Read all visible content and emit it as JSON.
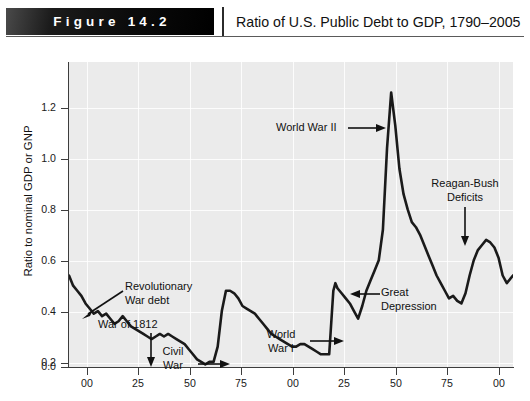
{
  "header": {
    "figure_label": "Figure 14.2",
    "title": "Ratio of U.S. Public Debt to GDP, 1790–2005"
  },
  "caption": "",
  "chart_data": {
    "type": "line",
    "title": "Ratio of U.S. Public Debt to GDP, 1790–2005",
    "xlabel": "",
    "ylabel": "Ratio to nominal GDP or GNP",
    "xlim": [
      1790,
      2005
    ],
    "ylim": [
      0.0,
      1.2
    ],
    "grid": true,
    "legend": "none",
    "line_color": "#1a1a1a",
    "plot_background": "#ebebeb",
    "ytick_labels": [
      "0.0",
      "0.2",
      "0.4",
      "0.6",
      "0.8",
      "1.0",
      "1.2"
    ],
    "ytick_values": [
      0.0,
      0.2,
      0.4,
      0.6,
      0.8,
      1.0,
      1.2
    ],
    "xtick_labels": [
      "00",
      "25",
      "50",
      "75",
      "00",
      "25",
      "50",
      "75",
      "00"
    ],
    "xtick_values": [
      1800,
      1825,
      1850,
      1875,
      1900,
      1925,
      1950,
      1975,
      2000
    ],
    "series": [
      {
        "name": "Public debt to GDP",
        "x": [
          1790,
          1792,
          1794,
          1796,
          1798,
          1800,
          1802,
          1804,
          1806,
          1808,
          1810,
          1812,
          1814,
          1816,
          1818,
          1820,
          1822,
          1824,
          1826,
          1828,
          1830,
          1832,
          1834,
          1836,
          1838,
          1840,
          1842,
          1844,
          1846,
          1848,
          1850,
          1852,
          1854,
          1856,
          1858,
          1860,
          1862,
          1864,
          1866,
          1868,
          1870,
          1872,
          1874,
          1876,
          1878,
          1880,
          1882,
          1884,
          1886,
          1888,
          1890,
          1892,
          1894,
          1896,
          1898,
          1900,
          1902,
          1904,
          1906,
          1908,
          1910,
          1912,
          1914,
          1916,
          1918,
          1919,
          1920,
          1922,
          1924,
          1926,
          1928,
          1930,
          1932,
          1934,
          1936,
          1938,
          1940,
          1942,
          1944,
          1946,
          1948,
          1950,
          1952,
          1954,
          1956,
          1958,
          1960,
          1962,
          1964,
          1966,
          1968,
          1970,
          1972,
          1974,
          1976,
          1978,
          1980,
          1982,
          1984,
          1986,
          1988,
          1990,
          1992,
          1994,
          1996,
          1998,
          2000,
          2002,
          2005
        ],
        "y": [
          0.36,
          0.32,
          0.3,
          0.28,
          0.25,
          0.23,
          0.21,
          0.22,
          0.2,
          0.21,
          0.19,
          0.17,
          0.18,
          0.2,
          0.18,
          0.16,
          0.15,
          0.14,
          0.13,
          0.12,
          0.11,
          0.12,
          0.13,
          0.12,
          0.13,
          0.12,
          0.11,
          0.1,
          0.09,
          0.07,
          0.05,
          0.03,
          0.02,
          0.01,
          0.02,
          0.02,
          0.08,
          0.22,
          0.3,
          0.3,
          0.29,
          0.27,
          0.24,
          0.23,
          0.22,
          0.21,
          0.19,
          0.17,
          0.15,
          0.13,
          0.12,
          0.11,
          0.1,
          0.09,
          0.08,
          0.08,
          0.09,
          0.09,
          0.08,
          0.07,
          0.06,
          0.05,
          0.05,
          0.05,
          0.3,
          0.33,
          0.31,
          0.29,
          0.27,
          0.25,
          0.22,
          0.19,
          0.24,
          0.3,
          0.34,
          0.38,
          0.42,
          0.54,
          0.86,
          1.08,
          0.95,
          0.78,
          0.68,
          0.62,
          0.57,
          0.55,
          0.52,
          0.48,
          0.44,
          0.4,
          0.36,
          0.33,
          0.3,
          0.27,
          0.28,
          0.26,
          0.25,
          0.29,
          0.36,
          0.42,
          0.46,
          0.48,
          0.5,
          0.49,
          0.47,
          0.43,
          0.36,
          0.33,
          0.36
        ]
      }
    ],
    "annotations": [
      {
        "name": "revolutionary-war-debt",
        "text": "Revolutionary\nWar debt",
        "arrow": "down-left"
      },
      {
        "name": "war-of-1812",
        "text": "War of 1812",
        "arrow": "down"
      },
      {
        "name": "civil-war",
        "text": "Civil\nWar",
        "arrow": "right"
      },
      {
        "name": "world-war-i",
        "text": "World\nWar I",
        "arrow": "right"
      },
      {
        "name": "world-war-ii",
        "text": "World War II",
        "arrow": "right"
      },
      {
        "name": "great-depression",
        "text": "Great\nDepression",
        "arrow": "left"
      },
      {
        "name": "reagan-bush-deficits",
        "text": "Reagan-Bush\nDeficits",
        "arrow": "down"
      }
    ]
  }
}
